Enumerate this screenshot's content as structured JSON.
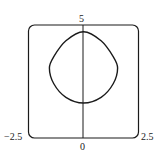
{
  "chart_data": {
    "type": "line",
    "title": "",
    "xlabel": "",
    "ylabel": "",
    "xlim": [
      -2.5,
      2.5
    ],
    "ylim": [
      0,
      5
    ],
    "grid": false,
    "tick_labels": {
      "x_min": "−2.5",
      "x_max": "2.5",
      "x_origin": "0",
      "y_max": "5"
    },
    "series": [
      {
        "name": "closed curve",
        "description": "rounded-diamond closed curve symmetric about x=0",
        "points": [
          [
            0,
            4.7
          ],
          [
            0.8,
            4.3
          ],
          [
            1.35,
            3.6
          ],
          [
            1.55,
            3.1
          ],
          [
            1.35,
            2.4
          ],
          [
            0.8,
            1.8
          ],
          [
            0,
            1.55
          ],
          [
            -0.8,
            1.8
          ],
          [
            -1.35,
            2.4
          ],
          [
            -1.55,
            3.1
          ],
          [
            -1.35,
            3.6
          ],
          [
            -0.8,
            4.3
          ],
          [
            0,
            4.7
          ]
        ]
      }
    ],
    "vertical_axis": {
      "x": 0
    }
  }
}
